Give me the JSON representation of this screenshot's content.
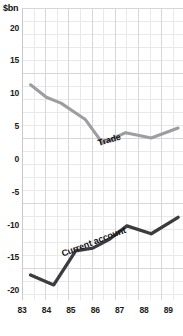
{
  "chart_data": {
    "type": "line",
    "title": "",
    "subtitle": "",
    "xlabel": "",
    "ylabel": "$bn",
    "unit_label": "$bn",
    "xlim": [
      83.0,
      89.6
    ],
    "ylim": [
      -21.5,
      23.0
    ],
    "grid": true,
    "legend_position": "inline-annotation",
    "y_ticks": [
      20,
      15,
      10,
      5,
      0,
      -5,
      -10,
      -15,
      -20
    ],
    "y_tick_labels": [
      "20",
      "15",
      "10",
      "5",
      "0",
      "-5",
      "-10",
      "-15",
      "-20"
    ],
    "x_ticks": [
      83,
      84,
      85,
      86,
      87,
      88,
      89
    ],
    "x_tick_labels": [
      "83",
      "84",
      "85",
      "86",
      "87",
      "88",
      "89"
    ],
    "series": [
      {
        "name": "Trade",
        "color": "#9d9da2",
        "x": [
          83.35,
          84.0,
          84.6,
          85.2,
          85.6,
          86.3,
          87.25,
          88.3,
          89.4
        ],
        "values": [
          11.3,
          9.4,
          8.5,
          7.0,
          6.0,
          2.4,
          4.0,
          3.2,
          4.7
        ]
      },
      {
        "name": "Current account",
        "color": "#3c3c40",
        "x": [
          83.35,
          84.3,
          85.2,
          85.9,
          86.6,
          87.3,
          88.3,
          89.4
        ],
        "values": [
          -17.7,
          -19.2,
          -14.0,
          -13.6,
          -12.2,
          -10.2,
          -11.4,
          -8.9
        ]
      }
    ],
    "annotations": [
      {
        "text": "Trade",
        "series": "Trade",
        "rotation_deg": -16
      },
      {
        "text": "Current account",
        "series": "Current account",
        "rotation_deg": -21
      }
    ],
    "colors": {
      "background": "#ffffff",
      "grid_minor": "#e9e9ec",
      "grid_major": "#d6d6db",
      "text": "#1b1b1b",
      "trade_line": "#9d9da2",
      "current_account_line": "#3c3c40"
    }
  }
}
